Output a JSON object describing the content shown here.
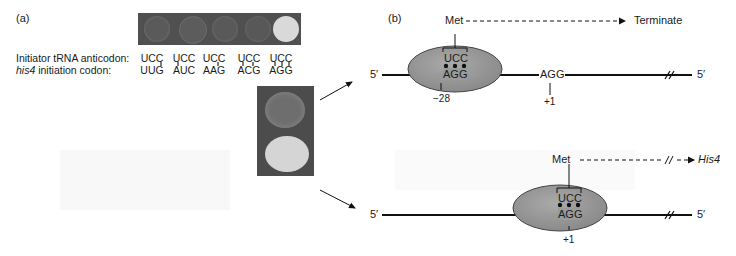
{
  "panel_a": {
    "label": "(a)",
    "row_labels": {
      "anticodon": "Initiator tRNA anticodon:",
      "codon_prefix": "his4",
      "codon_suffix": " initiation codon:"
    },
    "columns": [
      {
        "anticodon": "UCC",
        "codon": "UUG",
        "growth": "none"
      },
      {
        "anticodon": "UCC",
        "codon": "AUC",
        "growth": "none"
      },
      {
        "anticodon": "UCC",
        "codon": "AAG",
        "growth": "none"
      },
      {
        "anticodon": "UCC",
        "codon": "ACG",
        "growth": "none"
      },
      {
        "anticodon": "UCC",
        "codon": "AGG",
        "growth": "strong"
      }
    ],
    "enlarged_plate": {
      "top_colony": "weak",
      "bottom_colony": "strong"
    }
  },
  "panel_b": {
    "label": "(b)",
    "top_diagram": {
      "five_prime_left": "5′",
      "five_prime_right": "5′",
      "amino_acid": "Met",
      "outcome": "Terminate",
      "anticodon": "UCC",
      "paired_codon": "AGG",
      "second_codon": "AGG",
      "position_paired": "−28",
      "position_second": "+1"
    },
    "bottom_diagram": {
      "five_prime_left": "5′",
      "five_prime_right": "5′",
      "amino_acid": "Met",
      "outcome": "His4",
      "anticodon": "UCC",
      "paired_codon": "AGG",
      "position_paired": "+1"
    }
  },
  "colors": {
    "ribosome_fill": "#9a9a9a",
    "ribosome_stroke": "#444444",
    "plate_bg": "#505050",
    "colony_strong": "#d8d8d8",
    "line": "#111111"
  }
}
